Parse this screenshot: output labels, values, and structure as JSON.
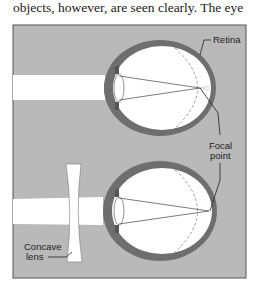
{
  "text": {
    "caption": "objects, however, are seen clearly. The eye"
  },
  "labels": {
    "retina": "Retina",
    "focal_line1": "Focal",
    "focal_line2": "point",
    "lens_line1": "Concave",
    "lens_line2": "lens"
  },
  "colors": {
    "background": "#b9b9b9",
    "eye_wall": "#6e6e6e",
    "eye_interior": "#ffffff",
    "frame_border": "#555555"
  }
}
